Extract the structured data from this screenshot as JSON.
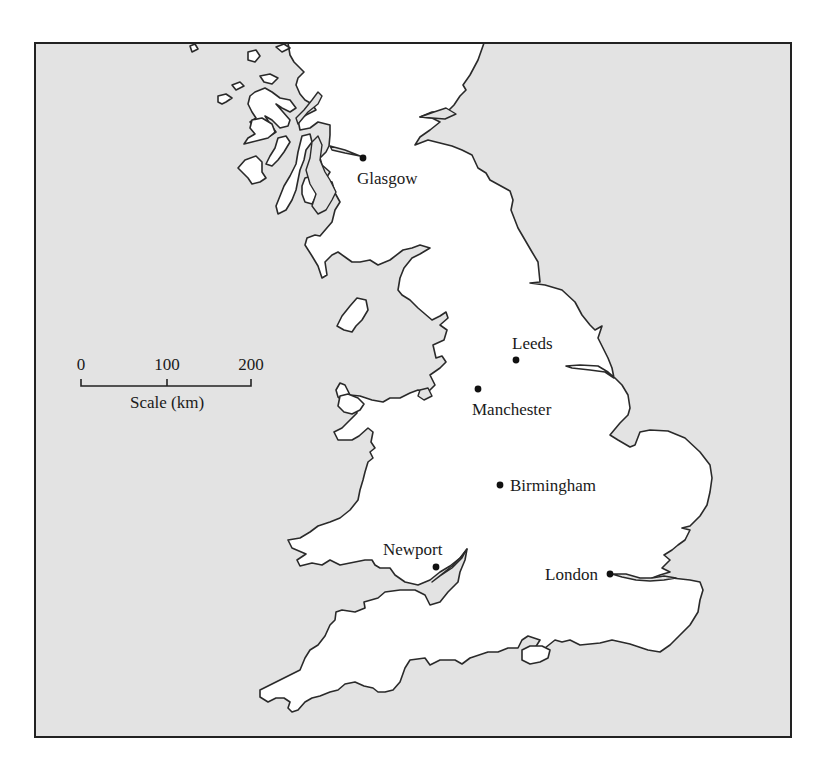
{
  "map": {
    "region": "Great Britain (Scotland south, England, Wales)",
    "colors": {
      "sea": "#e3e3e3",
      "land": "#ffffff",
      "coastline": "#2a2a2a",
      "frame": "#222222",
      "city_marker": "#111111"
    },
    "cities": [
      {
        "name": "Glasgow",
        "x": 363,
        "y": 158,
        "label_x": 357,
        "label_y": 184,
        "anchor": "start"
      },
      {
        "name": "Leeds",
        "x": 516,
        "y": 360,
        "label_x": 512,
        "label_y": 349,
        "anchor": "start"
      },
      {
        "name": "Manchester",
        "x": 478,
        "y": 389,
        "label_x": 472,
        "label_y": 415,
        "anchor": "start"
      },
      {
        "name": "Birmingham",
        "x": 500,
        "y": 485,
        "label_x": 510,
        "label_y": 491,
        "anchor": "start"
      },
      {
        "name": "Newport",
        "x": 436,
        "y": 567,
        "label_x": 383,
        "label_y": 555,
        "anchor": "start"
      },
      {
        "name": "London",
        "x": 610,
        "y": 574,
        "label_x": 598,
        "label_y": 580,
        "anchor": "end"
      }
    ],
    "scale_bar": {
      "title": "Scale (km)",
      "unit": "km",
      "ticks": [
        {
          "label": "0",
          "value": 0,
          "x": 81
        },
        {
          "label": "100",
          "value": 100,
          "x": 167
        },
        {
          "label": "200",
          "value": 200,
          "x": 251
        }
      ]
    }
  }
}
